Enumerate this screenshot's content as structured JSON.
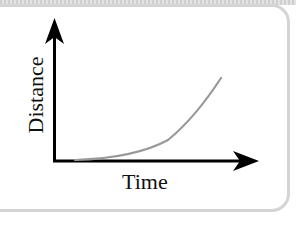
{
  "diagram": {
    "type": "distance-time graph",
    "x_axis_label": "Time",
    "y_axis_label": "Distance",
    "curve_description": "accelerating (curving upward) line starting at origin",
    "colors": {
      "axes": "#000000",
      "curve": "#999999",
      "panel_border": "#d4d4d4",
      "background": "#ffffff"
    }
  }
}
